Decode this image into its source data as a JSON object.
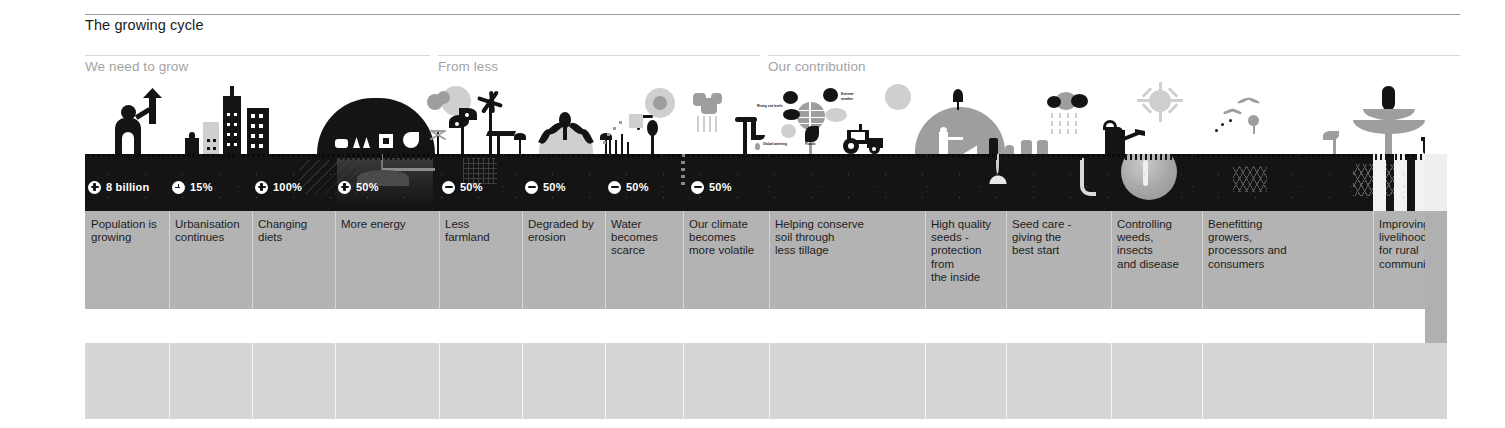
{
  "title": "The growing cycle",
  "sections": [
    {
      "label": "We need to grow",
      "left": 0,
      "width": 345
    },
    {
      "label": "From less",
      "left": 353,
      "width": 322
    },
    {
      "label": "Our contribution",
      "left": 683,
      "width": 692
    }
  ],
  "stats": [
    {
      "icon": "plus-icon",
      "value": "8 billion",
      "left": 3,
      "type": "plus"
    },
    {
      "icon": "clock-icon",
      "value": "15%",
      "left": 87,
      "type": "clock"
    },
    {
      "icon": "plus-icon",
      "value": "100%",
      "left": 170,
      "type": "plus"
    },
    {
      "icon": "plus-icon",
      "value": "50%",
      "left": 253,
      "type": "plus"
    },
    {
      "icon": "minus-icon",
      "value": "50%",
      "left": 357,
      "type": "minus"
    },
    {
      "icon": "minus-icon",
      "value": "50%",
      "left": 440,
      "type": "minus"
    },
    {
      "icon": "minus-icon",
      "value": "50%",
      "left": 523,
      "type": "minus"
    },
    {
      "icon": "minus-icon",
      "value": "50%",
      "left": 606,
      "type": "minus"
    }
  ],
  "columns": [
    {
      "text": "Population is\ngrowing",
      "left": 0,
      "width": 83
    },
    {
      "text": "Urbanisation\ncontinues",
      "left": 84,
      "width": 83
    },
    {
      "text": "Changing\ndiets",
      "left": 167,
      "width": 83
    },
    {
      "text": "More energy",
      "left": 250,
      "width": 100
    },
    {
      "text": "Less farmland",
      "left": 354,
      "width": 83
    },
    {
      "text": "Degraded by\nerosion",
      "left": 437,
      "width": 83
    },
    {
      "text": "Water\nbecomes\nscarce",
      "left": 520,
      "width": 78
    },
    {
      "text": "Our climate\nbecomes\nmore volatile",
      "left": 598,
      "width": 82
    },
    {
      "text": "Helping conserve\nsoil through\nless tillage",
      "left": 684,
      "width": 155
    },
    {
      "text": "High quality\nseeds -\nprotection\nfrom\nthe inside",
      "left": 840,
      "width": 80
    },
    {
      "text": "Seed care -\ngiving the\nbest start",
      "left": 921,
      "width": 95
    },
    {
      "text": "Controlling\nweeds,\ninsects\nand disease",
      "left": 1026,
      "width": 90
    },
    {
      "text": "Benefitting\ngrowers,\nprocessors and\nconsumers",
      "left": 1117,
      "width": 165
    },
    {
      "text": "Improving\nlivelihood\nfor rural\ncommunities",
      "left": 1288,
      "width": 87
    }
  ],
  "climate_labels": [
    {
      "text": "Rising sea levels",
      "left": 598,
      "top": 13
    },
    {
      "text": "Extreme",
      "left": 644,
      "top": 5
    },
    {
      "text": "weather",
      "left": 644,
      "top": 9
    },
    {
      "text": "Global warming",
      "left": 598,
      "top": 53
    },
    {
      "text": "Floods",
      "left": 641,
      "top": 53
    }
  ],
  "colors": {
    "soil": "#141414",
    "label_band": "#b3b3b3",
    "mid_band": "#b0b0b0",
    "low_band": "#d6d6d6",
    "title_text": "#1a1a1a",
    "section_text": "#a3a3a3",
    "stat_text": "#ffffff"
  }
}
